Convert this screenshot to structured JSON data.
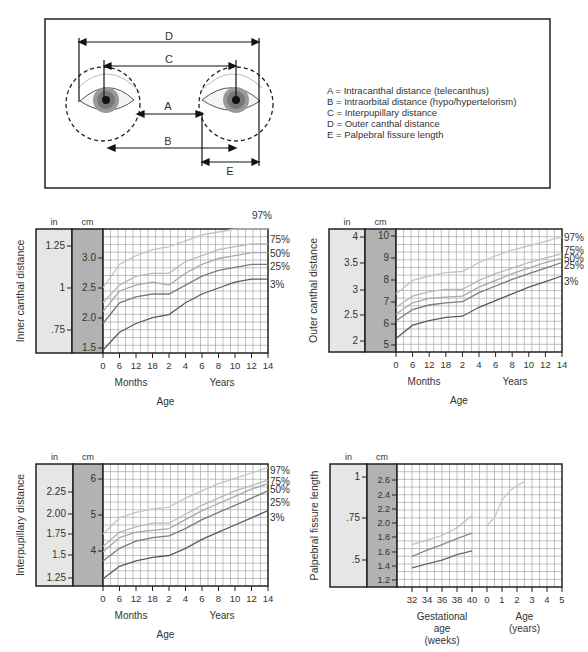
{
  "diagram": {
    "labels": {
      "A": "A",
      "B": "B",
      "C": "C",
      "D": "D",
      "E": "E"
    },
    "legend": [
      "A = Intracanthal distance (telecanthus)",
      "B = Intraorbital distance (hypo/hypertelorism)",
      "C = Interpupillary distance",
      "D = Outer canthal distance",
      "E = Palpebral fissure length"
    ]
  },
  "chart_data": [
    {
      "type": "line",
      "title": "",
      "ylabel": "Inner canthal distance",
      "xlabel": "Age",
      "x_sublabels": [
        "Months",
        "Years"
      ],
      "unit_headers": [
        "in",
        "cm"
      ],
      "in_ticks": [
        "1.25",
        "1",
        ".75"
      ],
      "cm_ticks": [
        "3.0",
        "2.5",
        "2.0",
        "1.5"
      ],
      "x_ticks": [
        "0",
        "6",
        "12",
        "18",
        "2",
        "4",
        "6",
        "8",
        "10",
        "12",
        "14"
      ],
      "ylim_cm": [
        1.45,
        3.55
      ],
      "x": [
        0,
        6,
        12,
        18,
        24,
        48,
        72,
        96,
        120,
        144,
        168
      ],
      "series": [
        {
          "name": "97%",
          "values": [
            2.55,
            2.95,
            3.1,
            3.2,
            3.25,
            3.35,
            3.45,
            3.5,
            3.55,
            3.55,
            3.55
          ]
        },
        {
          "name": "75%",
          "values": [
            2.3,
            2.6,
            2.75,
            2.8,
            2.8,
            3.0,
            3.1,
            3.2,
            3.25,
            3.3,
            3.3
          ]
        },
        {
          "name": "50%",
          "values": [
            2.15,
            2.5,
            2.6,
            2.65,
            2.6,
            2.8,
            2.95,
            3.05,
            3.1,
            3.15,
            3.15
          ]
        },
        {
          "name": "25%",
          "values": [
            1.95,
            2.3,
            2.4,
            2.45,
            2.45,
            2.6,
            2.75,
            2.85,
            2.9,
            2.95,
            2.95
          ]
        },
        {
          "name": "3%",
          "values": [
            1.5,
            1.8,
            1.95,
            2.05,
            2.1,
            2.3,
            2.45,
            2.55,
            2.65,
            2.7,
            2.7
          ]
        }
      ]
    },
    {
      "type": "line",
      "title": "",
      "ylabel": "Outer canthal distance",
      "xlabel": "Age",
      "x_sublabels": [
        "Months",
        "Years"
      ],
      "unit_headers": [
        "in",
        "cm"
      ],
      "in_ticks": [
        "4",
        "3.5",
        "3",
        "2.5",
        "2"
      ],
      "cm_ticks": [
        "10",
        "9",
        "8",
        "7",
        "6",
        "5"
      ],
      "x_ticks": [
        "0",
        "6",
        "12",
        "18",
        "2",
        "4",
        "6",
        "8",
        "10",
        "12",
        "14"
      ],
      "ylim_cm": [
        4.8,
        10.3
      ],
      "x": [
        0,
        6,
        12,
        18,
        24,
        48,
        72,
        96,
        120,
        144,
        168
      ],
      "series": [
        {
          "name": "97%",
          "values": [
            7.4,
            8.0,
            8.2,
            8.35,
            8.4,
            8.8,
            9.1,
            9.35,
            9.55,
            9.75,
            9.95
          ]
        },
        {
          "name": "75%",
          "values": [
            6.8,
            7.3,
            7.5,
            7.6,
            7.6,
            8.0,
            8.3,
            8.55,
            8.8,
            9.0,
            9.2
          ]
        },
        {
          "name": "50%",
          "values": [
            6.5,
            7.0,
            7.2,
            7.25,
            7.3,
            7.7,
            8.0,
            8.3,
            8.55,
            8.8,
            9.0
          ]
        },
        {
          "name": "25%",
          "values": [
            6.2,
            6.7,
            6.9,
            7.0,
            7.05,
            7.45,
            7.75,
            8.05,
            8.3,
            8.55,
            8.8
          ]
        },
        {
          "name": "3%",
          "values": [
            5.4,
            6.0,
            6.2,
            6.35,
            6.4,
            6.8,
            7.1,
            7.4,
            7.7,
            7.95,
            8.2
          ]
        }
      ]
    },
    {
      "type": "line",
      "title": "",
      "ylabel": "Interpupillary distance",
      "xlabel": "Age",
      "x_sublabels": [
        "Months",
        "Years"
      ],
      "unit_headers": [
        "in",
        "cm"
      ],
      "in_ticks": [
        "2.25",
        "2.00",
        "1.75",
        "1.5",
        "1.25"
      ],
      "cm_ticks": [
        "6",
        "5",
        "4"
      ],
      "x_ticks": [
        "0",
        "6",
        "12",
        "18",
        "2",
        "4",
        "6",
        "8",
        "10",
        "12",
        "14"
      ],
      "ylim_cm": [
        3.05,
        6.45
      ],
      "x": [
        0,
        6,
        12,
        18,
        24,
        48,
        72,
        96,
        120,
        144,
        168
      ],
      "series": [
        {
          "name": "97%",
          "values": [
            4.5,
            4.95,
            5.1,
            5.2,
            5.25,
            5.5,
            5.7,
            5.9,
            6.05,
            6.2,
            6.35
          ]
        },
        {
          "name": "75%",
          "values": [
            4.15,
            4.55,
            4.7,
            4.8,
            4.8,
            5.05,
            5.3,
            5.5,
            5.7,
            5.85,
            6.0
          ]
        },
        {
          "name": "50%",
          "values": [
            4.0,
            4.4,
            4.55,
            4.6,
            4.65,
            4.9,
            5.15,
            5.35,
            5.55,
            5.75,
            5.9
          ]
        },
        {
          "name": "25%",
          "values": [
            3.75,
            4.1,
            4.3,
            4.4,
            4.45,
            4.65,
            4.9,
            5.1,
            5.3,
            5.5,
            5.7
          ]
        },
        {
          "name": "3%",
          "values": [
            3.25,
            3.6,
            3.75,
            3.85,
            3.9,
            4.1,
            4.35,
            4.55,
            4.75,
            4.95,
            5.15
          ]
        }
      ]
    },
    {
      "type": "line",
      "title": "",
      "ylabel": "Palpebral fissure length",
      "xlabel_left": "Gestational age (weeks)",
      "xlabel_right": "Age (years)",
      "unit_headers": [
        "in",
        "cm"
      ],
      "in_ticks": [
        "1",
        ".75",
        ".5"
      ],
      "cm_ticks": [
        "2.6",
        "2.4",
        "2.2",
        "2.0",
        "1.8",
        "1.6",
        "1.4",
        "1.2"
      ],
      "x_ticks": [
        "32",
        "34",
        "36",
        "38",
        "40",
        "0",
        "1",
        "2",
        "3",
        "4",
        "5"
      ],
      "ylim_cm": [
        1.05,
        2.65
      ],
      "series": [
        {
          "name": "upper (gestational)",
          "x": [
            32,
            34,
            36,
            38,
            40
          ],
          "values": [
            1.6,
            1.66,
            1.72,
            1.82,
            1.98
          ]
        },
        {
          "name": "middle (gestational)",
          "x": [
            32,
            34,
            36,
            38,
            40
          ],
          "values": [
            1.45,
            1.53,
            1.6,
            1.68,
            1.75
          ]
        },
        {
          "name": "lower (gestational)",
          "x": [
            32,
            34,
            36,
            38,
            40
          ],
          "values": [
            1.3,
            1.35,
            1.4,
            1.47,
            1.52
          ]
        },
        {
          "name": "postnatal",
          "x_years": [
            0,
            0.5,
            1,
            1.5,
            2,
            2.5
          ],
          "values": [
            1.85,
            1.95,
            2.18,
            2.3,
            2.37,
            2.42
          ]
        }
      ]
    }
  ]
}
